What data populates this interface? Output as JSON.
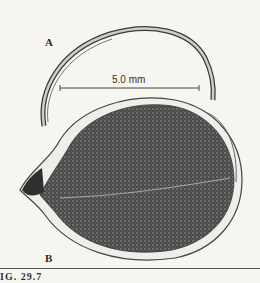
{
  "figure": {
    "panels": [
      {
        "label": "A",
        "subject": "curved spine / bristle"
      },
      {
        "label": "B",
        "subject": "oval shell with dense textured body"
      }
    ],
    "scale_bar": {
      "label": "5.0 mm"
    },
    "caption": "IG. 29.7"
  },
  "colors": {
    "background": "#f6f5ef",
    "ink": "#2a2a2a",
    "dark_fill": "#3d3d3d"
  }
}
